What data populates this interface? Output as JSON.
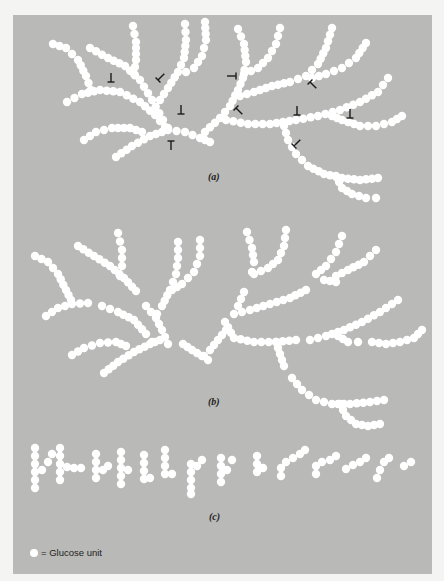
{
  "figure": {
    "panel_color": "#b9b9b7",
    "glucose_color": "#ffffff",
    "arrow_color": "#1a1a1a",
    "dot_radius": 4.2,
    "dot_spacing": 7,
    "captions": {
      "a": "(a)",
      "b": "(b)",
      "c": "(c)"
    },
    "legend": {
      "icon": "glucose-unit-circle",
      "label": "= Glucose unit"
    }
  },
  "parts": {
    "a": {
      "chains": [
        [
          [
            53,
            44
          ],
          [
            66,
            48
          ],
          [
            78,
            60
          ],
          [
            86,
            76
          ],
          [
            91,
            90
          ]
        ],
        [
          [
            67,
            102
          ],
          [
            82,
            94
          ],
          [
            100,
            90
          ],
          [
            120,
            92
          ],
          [
            140,
            102
          ],
          [
            155,
            115
          ],
          [
            165,
            127
          ]
        ],
        [
          [
            90,
            48
          ],
          [
            108,
            58
          ],
          [
            125,
            66
          ],
          [
            140,
            80
          ],
          [
            152,
            100
          ],
          [
            163,
            120
          ],
          [
            168,
            128
          ]
        ],
        [
          [
            133,
            26
          ],
          [
            136,
            42
          ],
          [
            136,
            60
          ],
          [
            134,
            74
          ]
        ],
        [
          [
            185,
            24
          ],
          [
            186,
            40
          ],
          [
            184,
            58
          ],
          [
            178,
            72
          ],
          [
            168,
            88
          ],
          [
            160,
            100
          ]
        ],
        [
          [
            205,
            22
          ],
          [
            206,
            40
          ],
          [
            202,
            56
          ],
          [
            194,
            68
          ],
          [
            186,
            72
          ]
        ],
        [
          [
            84,
            140
          ],
          [
            96,
            132
          ],
          [
            112,
            128
          ],
          [
            130,
            128
          ],
          [
            142,
            132
          ]
        ],
        [
          [
            116,
            157
          ],
          [
            132,
            146
          ],
          [
            150,
            136
          ],
          [
            168,
            130
          ],
          [
            185,
            132
          ],
          [
            200,
            138
          ],
          [
            210,
            142
          ]
        ],
        [
          [
            238,
            29
          ],
          [
            244,
            44
          ],
          [
            246,
            62
          ],
          [
            243,
            78
          ],
          [
            238,
            90
          ],
          [
            230,
            106
          ],
          [
            220,
            118
          ],
          [
            205,
            132
          ]
        ],
        [
          [
            280,
            28
          ],
          [
            276,
            44
          ],
          [
            268,
            58
          ],
          [
            258,
            68
          ],
          [
            244,
            74
          ]
        ],
        [
          [
            332,
            28
          ],
          [
            326,
            48
          ],
          [
            318,
            64
          ],
          [
            306,
            76
          ],
          [
            290,
            82
          ],
          [
            272,
            86
          ],
          [
            254,
            92
          ],
          [
            240,
            96
          ]
        ],
        [
          [
            366,
            43
          ],
          [
            356,
            58
          ],
          [
            342,
            68
          ],
          [
            326,
            74
          ],
          [
            312,
            78
          ]
        ],
        [
          [
            388,
            78
          ],
          [
            378,
            92
          ],
          [
            360,
            102
          ],
          [
            340,
            110
          ],
          [
            318,
            116
          ],
          [
            296,
            120
          ],
          [
            270,
            124
          ],
          [
            248,
            124
          ],
          [
            226,
            120
          ]
        ],
        [
          [
            402,
            116
          ],
          [
            392,
            122
          ],
          [
            376,
            126
          ],
          [
            360,
            126
          ],
          [
            342,
            120
          ],
          [
            332,
            116
          ]
        ],
        [
          [
            284,
            126
          ],
          [
            288,
            140
          ],
          [
            296,
            154
          ],
          [
            308,
            166
          ],
          [
            324,
            174
          ],
          [
            342,
            178
          ],
          [
            360,
            180
          ],
          [
            378,
            178
          ]
        ],
        [
          [
            336,
            176
          ],
          [
            342,
            188
          ],
          [
            352,
            194
          ],
          [
            366,
            198
          ],
          [
            376,
            198
          ]
        ]
      ],
      "arrows": [
        {
          "x": 111,
          "y": 82,
          "dir": "down"
        },
        {
          "x": 158,
          "y": 80,
          "dir": "down-left"
        },
        {
          "x": 181,
          "y": 114,
          "dir": "down"
        },
        {
          "x": 171,
          "y": 141,
          "dir": "up"
        },
        {
          "x": 236,
          "y": 76,
          "dir": "right"
        },
        {
          "x": 236,
          "y": 108,
          "dir": "up-left"
        },
        {
          "x": 310,
          "y": 82,
          "dir": "up-left"
        },
        {
          "x": 297,
          "y": 115,
          "dir": "down"
        },
        {
          "x": 350,
          "y": 118,
          "dir": "down"
        },
        {
          "x": 294,
          "y": 146,
          "dir": "down-left"
        }
      ]
    },
    "b": {
      "chains": [
        [
          [
            35,
            256
          ],
          [
            48,
            262
          ],
          [
            58,
            274
          ],
          [
            66,
            290
          ],
          [
            71,
            300
          ]
        ],
        [
          [
            46,
            316
          ],
          [
            58,
            308
          ],
          [
            72,
            304
          ],
          [
            88,
            303
          ]
        ],
        [
          [
            78,
            246
          ],
          [
            94,
            256
          ],
          [
            110,
            266
          ],
          [
            124,
            278
          ],
          [
            136,
            291
          ]
        ],
        [
          [
            118,
            233
          ],
          [
            122,
            250
          ],
          [
            122,
            266
          ],
          [
            120,
            276
          ]
        ],
        [
          [
            102,
            306
          ],
          [
            118,
            312
          ],
          [
            134,
            320
          ],
          [
            146,
            334
          ],
          [
            152,
            342
          ]
        ],
        [
          [
            72,
            355
          ],
          [
            84,
            348
          ],
          [
            100,
            343
          ],
          [
            116,
            342
          ],
          [
            126,
            346
          ]
        ],
        [
          [
            104,
            373
          ],
          [
            118,
            362
          ],
          [
            134,
            352
          ],
          [
            150,
            344
          ],
          [
            160,
            340
          ]
        ],
        [
          [
            146,
            306
          ],
          [
            156,
            318
          ],
          [
            162,
            330
          ],
          [
            168,
            344
          ]
        ],
        [
          [
            178,
            242
          ],
          [
            178,
            258
          ],
          [
            176,
            274
          ],
          [
            170,
            290
          ],
          [
            162,
            306
          ],
          [
            157,
            314
          ]
        ],
        [
          [
            200,
            240
          ],
          [
            200,
            256
          ],
          [
            194,
            272
          ],
          [
            182,
            284
          ],
          [
            172,
            290
          ]
        ],
        [
          [
            183,
            344
          ],
          [
            192,
            350
          ],
          [
            202,
            356
          ],
          [
            208,
            360
          ]
        ],
        [
          [
            226,
            330
          ],
          [
            218,
            340
          ],
          [
            210,
            350
          ],
          [
            204,
            356
          ]
        ],
        [
          [
            247,
            232
          ],
          [
            252,
            248
          ],
          [
            254,
            262
          ],
          [
            252,
            272
          ]
        ],
        [
          [
            286,
            230
          ],
          [
            284,
            246
          ],
          [
            278,
            260
          ],
          [
            268,
            268
          ],
          [
            254,
            274
          ]
        ],
        [
          [
            342,
            236
          ],
          [
            336,
            252
          ],
          [
            326,
            266
          ],
          [
            316,
            274
          ],
          [
            324,
            280
          ],
          [
            336,
            282
          ]
        ],
        [
          [
            376,
            250
          ],
          [
            364,
            262
          ],
          [
            348,
            270
          ],
          [
            336,
            276
          ]
        ],
        [
          [
            244,
            292
          ],
          [
            238,
            306
          ],
          [
            234,
            314
          ],
          [
            250,
            310
          ],
          [
            270,
            304
          ],
          [
            290,
            298
          ],
          [
            306,
            290
          ]
        ],
        [
          [
            225,
            322
          ],
          [
            234,
            338
          ],
          [
            254,
            342
          ],
          [
            276,
            342
          ],
          [
            296,
            340
          ]
        ],
        [
          [
            276,
            342
          ],
          [
            280,
            354
          ],
          [
            284,
            366
          ]
        ],
        [
          [
            310,
            340
          ],
          [
            326,
            336
          ],
          [
            344,
            330
          ],
          [
            362,
            322
          ],
          [
            380,
            312
          ],
          [
            398,
            300
          ]
        ],
        [
          [
            338,
            336
          ],
          [
            348,
            342
          ],
          [
            358,
            342
          ]
        ],
        [
          [
            372,
            342
          ],
          [
            386,
            344
          ],
          [
            400,
            342
          ],
          [
            414,
            338
          ],
          [
            422,
            330
          ]
        ],
        [
          [
            292,
            378
          ],
          [
            302,
            390
          ],
          [
            316,
            400
          ],
          [
            332,
            404
          ],
          [
            350,
            404
          ],
          [
            370,
            402
          ],
          [
            384,
            400
          ]
        ],
        [
          [
            340,
            404
          ],
          [
            346,
            416
          ],
          [
            356,
            424
          ],
          [
            368,
            426
          ],
          [
            380,
            424
          ]
        ]
      ]
    },
    "c": {
      "fragments": [
        [
          [
            35,
            448
          ],
          [
            35,
            456
          ],
          [
            35,
            464
          ],
          [
            35,
            472
          ],
          [
            35,
            480
          ],
          [
            35,
            488
          ],
          [
            42,
            470
          ],
          [
            48,
            462
          ],
          [
            52,
            454
          ]
        ],
        [
          [
            60,
            448
          ],
          [
            60,
            456
          ],
          [
            60,
            464
          ],
          [
            60,
            472
          ],
          [
            60,
            480
          ],
          [
            67,
            467
          ],
          [
            74,
            468
          ],
          [
            81,
            468
          ]
        ],
        [
          [
            96,
            454
          ],
          [
            96,
            462
          ],
          [
            96,
            470
          ],
          [
            96,
            478
          ],
          [
            103,
            470
          ],
          [
            108,
            466
          ]
        ],
        [
          [
            121,
            452
          ],
          [
            121,
            460
          ],
          [
            121,
            468
          ],
          [
            121,
            476
          ],
          [
            121,
            484
          ],
          [
            128,
            470
          ]
        ],
        [
          [
            144,
            455
          ],
          [
            144,
            463
          ],
          [
            144,
            471
          ],
          [
            144,
            479
          ],
          [
            150,
            478
          ]
        ],
        [
          [
            165,
            450
          ],
          [
            165,
            458
          ],
          [
            165,
            466
          ],
          [
            165,
            474
          ],
          [
            172,
            474
          ]
        ],
        [
          [
            191,
            464
          ],
          [
            191,
            472
          ],
          [
            191,
            480
          ],
          [
            191,
            488
          ],
          [
            191,
            494
          ],
          [
            197,
            466
          ],
          [
            202,
            460
          ]
        ],
        [
          [
            221,
            458
          ],
          [
            221,
            466
          ],
          [
            221,
            474
          ],
          [
            221,
            482
          ],
          [
            227,
            470
          ],
          [
            232,
            460
          ]
        ],
        [
          [
            257,
            456
          ],
          [
            257,
            464
          ],
          [
            257,
            472
          ],
          [
            263,
            468
          ]
        ],
        [
          [
            281,
            476
          ],
          [
            281,
            468
          ],
          [
            286,
            462
          ],
          [
            293,
            458
          ],
          [
            300,
            454
          ],
          [
            305,
            450
          ]
        ],
        [
          [
            316,
            474
          ],
          [
            316,
            466
          ],
          [
            322,
            462
          ],
          [
            330,
            460
          ],
          [
            336,
            456
          ]
        ],
        [
          [
            346,
            469
          ],
          [
            353,
            465
          ],
          [
            360,
            462
          ],
          [
            366,
            458
          ]
        ],
        [
          [
            377,
            478
          ],
          [
            380,
            470
          ],
          [
            384,
            462
          ],
          [
            389,
            458
          ]
        ],
        [
          [
            404,
            466
          ],
          [
            411,
            462
          ]
        ]
      ]
    }
  }
}
